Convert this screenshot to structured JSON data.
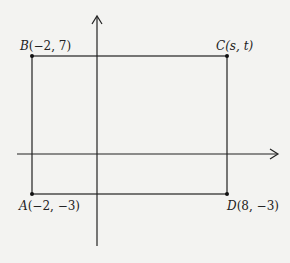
{
  "diagram": {
    "type": "coordinate-plane-rectangle",
    "points": [
      {
        "id": "A",
        "name": "A",
        "coords": "(−2, −3)",
        "x": -2,
        "y": -3
      },
      {
        "id": "B",
        "name": "B",
        "coords": "(−2, 7)",
        "x": -2,
        "y": 7
      },
      {
        "id": "C",
        "name": "C",
        "coords": "(s, t)",
        "x": "s",
        "y": "t"
      },
      {
        "id": "D",
        "name": "D",
        "coords": "(8, −3)",
        "x": 8,
        "y": -3
      }
    ],
    "colors": {
      "background": "#f3f3f1",
      "stroke": "#222222"
    }
  }
}
